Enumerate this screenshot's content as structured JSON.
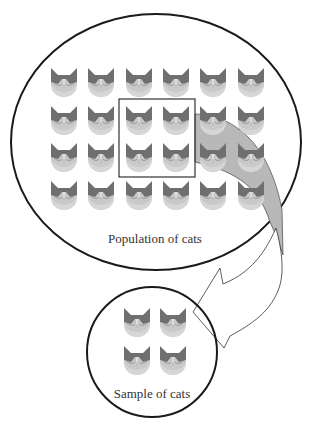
{
  "diagram": {
    "population": {
      "label": "Population of cats",
      "rows": 4,
      "cols": 6,
      "cat_count": 24,
      "ellipse": {
        "cx": 156,
        "cy": 142,
        "rx": 145,
        "ry": 128
      }
    },
    "selection_box": {
      "rows": 2,
      "cols": 2,
      "x": 119,
      "y": 99,
      "w": 76,
      "h": 78
    },
    "sample": {
      "label": "Sample of cats",
      "cat_count": 4,
      "circle": {
        "cx": 152,
        "cy": 352,
        "r": 65
      }
    },
    "arrow": {
      "direction": "from selection box in population to sample circle",
      "fill_color": "#b8b8b8"
    },
    "colors": {
      "outline": "#1a1a1a",
      "arrow_fill": "#b8b8b8",
      "cat_dark": "#6e6e6e",
      "cat_light": "#c8c8c8"
    }
  }
}
